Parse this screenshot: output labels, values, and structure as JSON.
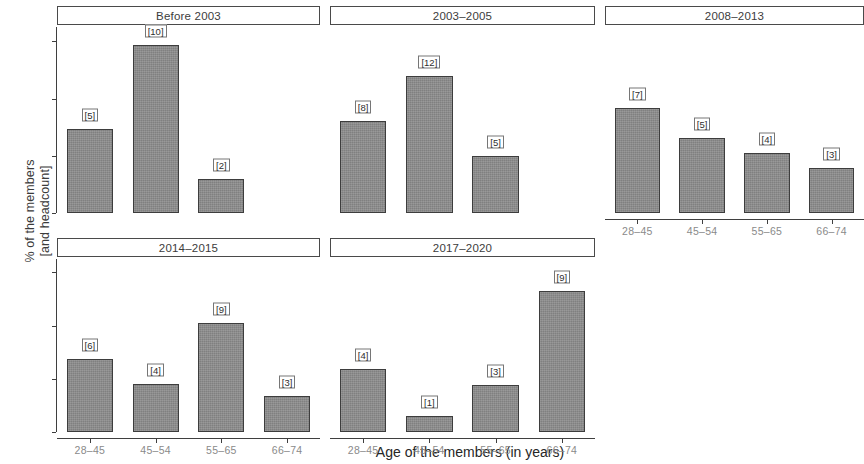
{
  "axes": {
    "y_title_line1": "% of the members",
    "y_title_line2": "[and headcount]",
    "x_title": "Age of the members (in years)",
    "y_ticks": [
      "0",
      "20",
      "40",
      "60"
    ],
    "x_ticks": [
      "28–45",
      "45–54",
      "55–65",
      "66–74"
    ]
  },
  "chart_data": {
    "type": "bar",
    "title": "",
    "subtitle": "",
    "xlabel": "Age of the members (in years)",
    "ylabel": "% of the members [and headcount]",
    "ylim": [
      0,
      65
    ],
    "y_ticks": [
      0,
      20,
      40,
      60
    ],
    "grid": false,
    "legend": "none",
    "facet_layout": {
      "rows": 2,
      "cols": 3,
      "wrap": true,
      "empty_cells": [
        5
      ]
    },
    "categories": [
      "28–45",
      "45–54",
      "55–65",
      "66–74"
    ],
    "value_unit": "percent",
    "point_label_format": "[headcount]",
    "facets": [
      {
        "name": "Before 2003",
        "categories": [
          "28–45",
          "45–54",
          "55–65"
        ],
        "values": [
          29.4,
          58.8,
          11.8
        ],
        "counts": [
          5,
          10,
          2
        ],
        "labels": [
          "[5]",
          "[10]",
          "[2]"
        ],
        "total": 17,
        "show_x_axis_labels": false
      },
      {
        "name": "2003–2005",
        "categories": [
          "28–45",
          "45–54",
          "55–65"
        ],
        "values": [
          32.0,
          48.0,
          20.0
        ],
        "counts": [
          8,
          12,
          5
        ],
        "labels": [
          "[8]",
          "[12]",
          "[5]"
        ],
        "total": 25,
        "show_x_axis_labels": false
      },
      {
        "name": "2008–2013",
        "categories": [
          "28–45",
          "45–54",
          "55–65",
          "66–74"
        ],
        "values": [
          36.8,
          26.3,
          21.1,
          15.8
        ],
        "counts": [
          7,
          5,
          4,
          3
        ],
        "labels": [
          "[7]",
          "[5]",
          "[4]",
          "[3]"
        ],
        "total": 19,
        "show_x_axis_labels": true
      },
      {
        "name": "2014–2015",
        "categories": [
          "28–45",
          "45–54",
          "55–65",
          "66–74"
        ],
        "values": [
          27.3,
          18.2,
          40.9,
          13.6
        ],
        "counts": [
          6,
          4,
          9,
          3
        ],
        "labels": [
          "[6]",
          "[4]",
          "[9]",
          "[3]"
        ],
        "total": 22,
        "show_x_axis_labels": true
      },
      {
        "name": "2017–2020",
        "categories": [
          "28–45",
          "45–54",
          "55–65",
          "66–74"
        ],
        "values": [
          23.5,
          5.9,
          17.6,
          52.9
        ],
        "counts": [
          4,
          1,
          3,
          9
        ],
        "labels": [
          "[4]",
          "[1]",
          "[3]",
          "[9]"
        ],
        "total": 17,
        "show_x_axis_labels": true
      }
    ]
  },
  "style": {
    "bar_fill": "#8d8d8d",
    "bar_stroke": "#3d3d3d",
    "panel_background": "#ffffff",
    "strip_background": "#ffffff",
    "strip_border": "#4a4a4a",
    "axis_color": "#3f3f3f",
    "tick_label_color": "#8a8a8a"
  }
}
